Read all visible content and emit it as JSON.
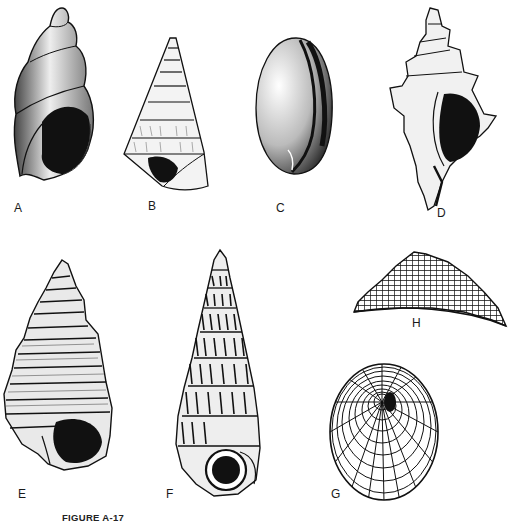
{
  "figure": {
    "caption": "FIGURE A-17",
    "panels": [
      {
        "id": "A",
        "label": "A",
        "shape": "turreted-spiral-shell",
        "icon": "snail-shell-icon"
      },
      {
        "id": "B",
        "label": "B",
        "shape": "conical-trochiform-shell",
        "icon": "cone-shell-icon"
      },
      {
        "id": "C",
        "label": "C",
        "shape": "ovate-cowrie-like-shell",
        "icon": "ovate-shell-icon"
      },
      {
        "id": "D",
        "label": "D",
        "shape": "spiny-murex-shell",
        "icon": "spiny-shell-icon"
      },
      {
        "id": "E",
        "label": "E",
        "shape": "ribbed-turreted-shell",
        "icon": "ribbed-spire-shell-icon"
      },
      {
        "id": "F",
        "label": "F",
        "shape": "tall-wentletrap-shell",
        "icon": "tall-spire-shell-icon"
      },
      {
        "id": "G",
        "label": "G",
        "shape": "oval-reticulated-limpet-top-view",
        "icon": "limpet-top-icon"
      },
      {
        "id": "H",
        "label": "H",
        "shape": "reticulated-limpet-side-view",
        "icon": "limpet-side-icon"
      }
    ]
  },
  "colors": {
    "ink": "#111111",
    "paper": "#ffffff",
    "shade": "#555555"
  }
}
